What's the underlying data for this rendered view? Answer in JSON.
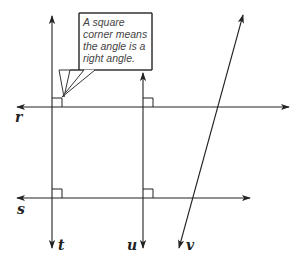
{
  "figure": {
    "callout": {
      "lines": [
        "A square",
        "corner means",
        "the angle is a",
        "right angle."
      ],
      "full_text": "A square corner means the angle is a right angle."
    },
    "lines": [
      {
        "id": "r",
        "label": "r",
        "orientation": "horizontal"
      },
      {
        "id": "s",
        "label": "s",
        "orientation": "horizontal"
      },
      {
        "id": "t",
        "label": "t",
        "orientation": "vertical"
      },
      {
        "id": "u",
        "label": "u",
        "orientation": "vertical"
      },
      {
        "id": "v",
        "label": "v",
        "orientation": "slanted"
      }
    ],
    "right_angle_markers": [
      {
        "at": "r-t"
      },
      {
        "at": "r-u"
      },
      {
        "at": "s-t"
      },
      {
        "at": "s-u"
      }
    ],
    "colors": {
      "line": "#222222",
      "background": "#ffffff"
    }
  }
}
